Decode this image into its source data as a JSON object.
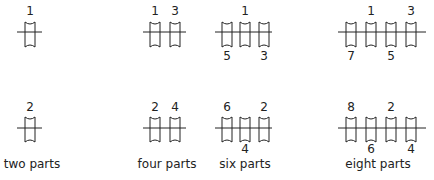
{
  "diagrams": [
    {
      "id": "two-parts",
      "caption": "two parts",
      "top": {
        "pulleys_x": [
          30
        ],
        "line": [
          17,
          42
        ],
        "labels_above": [
          {
            "text": "1",
            "x": 30
          }
        ],
        "labels_below": []
      },
      "bottom": {
        "pulleys_x": [
          30
        ],
        "line": [
          17,
          42
        ],
        "labels_above": [
          {
            "text": "2",
            "x": 30
          }
        ],
        "labels_below": []
      }
    },
    {
      "id": "four-parts",
      "caption": "four parts",
      "top": {
        "pulleys_x": [
          155,
          175
        ],
        "line": [
          143,
          186
        ],
        "labels_above": [
          {
            "text": "1",
            "x": 155
          },
          {
            "text": "3",
            "x": 175
          }
        ],
        "labels_below": []
      },
      "bottom": {
        "pulleys_x": [
          155,
          175
        ],
        "line": [
          143,
          186
        ],
        "labels_above": [
          {
            "text": "2",
            "x": 155
          },
          {
            "text": "4",
            "x": 175
          }
        ],
        "labels_below": []
      }
    },
    {
      "id": "six-parts",
      "caption": "six parts",
      "top": {
        "pulleys_x": [
          227,
          245,
          264
        ],
        "line": [
          215,
          272
        ],
        "labels_above": [
          {
            "text": "1",
            "x": 245
          }
        ],
        "labels_below": [
          {
            "text": "5",
            "x": 227
          },
          {
            "text": "3",
            "x": 264
          }
        ]
      },
      "bottom": {
        "pulleys_x": [
          227,
          245,
          264
        ],
        "line": [
          215,
          272
        ],
        "labels_above": [
          {
            "text": "6",
            "x": 227
          },
          {
            "text": "2",
            "x": 264
          }
        ],
        "labels_below": [
          {
            "text": "4",
            "x": 245
          }
        ]
      }
    },
    {
      "id": "eight-parts",
      "caption": "eight parts",
      "top": {
        "pulleys_x": [
          351,
          371,
          391,
          411
        ],
        "line": [
          338,
          426
        ],
        "labels_above": [
          {
            "text": "1",
            "x": 371
          },
          {
            "text": "3",
            "x": 411
          }
        ],
        "labels_below": [
          {
            "text": "7",
            "x": 351
          },
          {
            "text": "5",
            "x": 391
          }
        ]
      },
      "bottom": {
        "pulleys_x": [
          351,
          371,
          391,
          411
        ],
        "line": [
          338,
          426
        ],
        "labels_above": [
          {
            "text": "8",
            "x": 351
          },
          {
            "text": "2",
            "x": 391
          }
        ],
        "labels_below": [
          {
            "text": "6",
            "x": 371
          },
          {
            "text": "4",
            "x": 411
          }
        ]
      }
    }
  ],
  "captions": {
    "two": "two parts",
    "four": "four parts",
    "six": "six parts",
    "eight": "eight parts"
  },
  "caption_x": {
    "two": 32,
    "four": 167,
    "six": 245,
    "eight": 378
  },
  "layout": {
    "top_row": {
      "pulley_top": 22,
      "pulley_bottom": 47,
      "line_y": 32,
      "label_above_y": 5,
      "label_below_y": 50
    },
    "bottom_row": {
      "pulley_top": 117,
      "pulley_bottom": 142,
      "line_y": 128,
      "label_above_y": 101,
      "label_below_y": 143
    },
    "caption_y": 157
  },
  "colors": {
    "stroke": "#222222",
    "background": "#ffffff"
  }
}
